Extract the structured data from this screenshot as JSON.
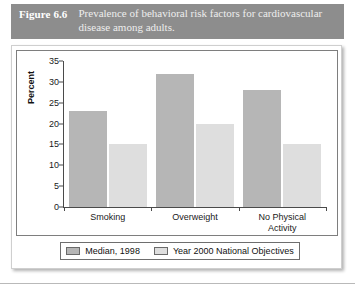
{
  "figure": {
    "number_label": "Figure 6.6",
    "caption": "Prevalence of behavioral risk factors for cardiovascular disease among adults."
  },
  "colors": {
    "caption_band": "#8d8d8d",
    "series_0": "#b6b6b6",
    "series_1": "#dedede",
    "axis": "#4a4a4a",
    "frame": "#7e7e7e"
  },
  "chart_data": {
    "type": "bar",
    "title": "Prevalence of behavioral risk factors for cardiovascular disease among adults.",
    "xlabel": "",
    "ylabel": "Percent",
    "ylim": [
      0,
      35
    ],
    "yticks": [
      0,
      5,
      10,
      15,
      20,
      25,
      30,
      35
    ],
    "ytick_labels": [
      "0",
      "5",
      "10",
      "15",
      "20",
      "25",
      "30",
      "35"
    ],
    "grid": false,
    "legend_position": "bottom",
    "categories": [
      "Smoking",
      "Overweight",
      "No Physical Activity"
    ],
    "category_lines": [
      [
        "Smoking"
      ],
      [
        "Overweight"
      ],
      [
        "No Physical",
        "Activity"
      ]
    ],
    "series": [
      {
        "name": "Median, 1998",
        "values": [
          23,
          32,
          28
        ]
      },
      {
        "name": "Year 2000 National Objectives",
        "values": [
          15,
          20,
          15
        ]
      }
    ]
  }
}
